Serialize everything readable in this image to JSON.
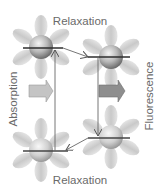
{
  "diagram": {
    "type": "energy-transition-cycle",
    "labels": {
      "top": "Relaxation",
      "bottom": "Relaxation",
      "left": "Absorption",
      "right": "Fluorescence"
    },
    "colors": {
      "petal": "#d2d2d2",
      "sphere_light": "#f2f2f2",
      "sphere_dark": "#7a7a7a",
      "level_line": "#333333",
      "arrow_line": "#555555",
      "block_arrow_left": "#bdbdbd",
      "block_arrow_right": "#8a8a8a",
      "text": "#6a6a6a"
    },
    "molecules": [
      {
        "id": "top-left",
        "state": "excited-upper",
        "cx": 41,
        "cy": 47
      },
      {
        "id": "top-right",
        "state": "excited-relaxed",
        "cx": 111,
        "cy": 57
      },
      {
        "id": "bottom-right",
        "state": "ground-upper",
        "cx": 111,
        "cy": 137
      },
      {
        "id": "bottom-left",
        "state": "ground-relaxed",
        "cx": 41,
        "cy": 150
      }
    ]
  }
}
